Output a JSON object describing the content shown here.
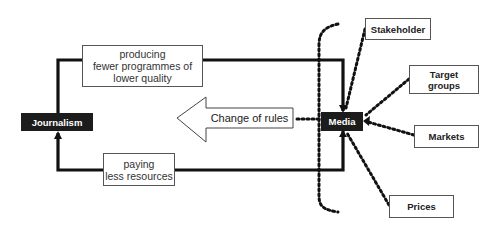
{
  "diagram": {
    "nodes": {
      "journalism": "Journalism",
      "media": "Media",
      "stakeholder": "Stakeholder",
      "target_groups": "Target\ngroups",
      "markets": "Markets",
      "prices": "Prices"
    },
    "edges": {
      "top_label": "producing\nfewer programmes of\nlower quality",
      "bottom_label": "paying\nless resources",
      "change_label": "Change of rules"
    },
    "colors": {
      "dark_box": "#1c1c1c",
      "line": "#111111",
      "border": "#555555"
    }
  }
}
